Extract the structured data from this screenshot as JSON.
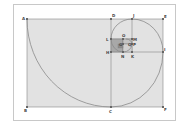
{
  "diagram": {
    "type": "golden-spiral",
    "colors": {
      "fill": "#e2e2e2",
      "inner_fill": "#a8a8a8",
      "innermost_fill": "#8c8c8c",
      "line": "#888888",
      "spiral": "#8a8a8a",
      "frame": "#c8c8c8"
    },
    "points": {
      "A": "A",
      "B": "B",
      "C": "C",
      "D": "D",
      "E": "E",
      "F": "F",
      "G": "G",
      "H": "H",
      "I": "I",
      "J": "J",
      "K": "K",
      "L": "L",
      "M": "M",
      "N": "N",
      "O": "O",
      "P": "P",
      "Q": "Q"
    }
  }
}
